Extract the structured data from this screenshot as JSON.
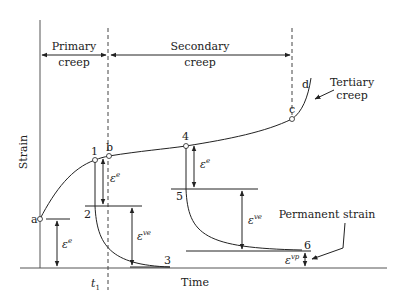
{
  "diagram": {
    "type": "creep strain vs time",
    "axes": {
      "y_label": "Strain",
      "x_label": "Time",
      "x_tick": {
        "base": "t",
        "subscript": "1"
      }
    },
    "regions": [
      {
        "label_line1": "Primary",
        "label_line2": "creep"
      },
      {
        "label_line1": "Secondary",
        "label_line2": "creep"
      },
      {
        "label_line1": "Tertiary",
        "label_line2": "creep"
      }
    ],
    "points": {
      "a": "a",
      "b": "b",
      "c": "c",
      "d": "d",
      "p1": "1",
      "p2": "2",
      "p3": "3",
      "p4": "4",
      "p5": "5",
      "p6": "6"
    },
    "strain_symbols": {
      "elastic": {
        "base": "ε",
        "sup": "e"
      },
      "viscoelastic": {
        "base": "ε",
        "sup": "ve"
      },
      "viscoplastic": {
        "base": "ε",
        "sup": "vp"
      }
    },
    "annotations": {
      "permanent_strain": "Permanent strain"
    },
    "colors": {
      "line": "#222222",
      "dashed": "#444444",
      "axis": "#555555",
      "background": "#ffffff"
    }
  }
}
